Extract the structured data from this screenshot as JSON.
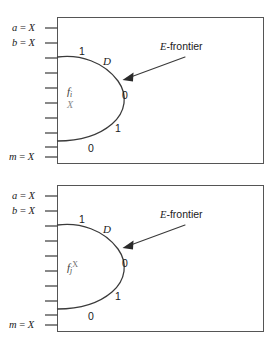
{
  "figure": {
    "type": "diagram",
    "panels": [
      {
        "id": "top",
        "inputs": [
          {
            "label_name": "a",
            "operator": "=",
            "value": "X"
          },
          {
            "label_name": "b",
            "operator": "=",
            "value": "X"
          },
          {
            "label_name": "m",
            "operator": "=",
            "value": "X"
          }
        ],
        "tick_count": 10,
        "curve_bits": [
          {
            "value": "1",
            "position": "upper-left"
          },
          {
            "value": "0",
            "position": "right-upper"
          },
          {
            "value": "1",
            "position": "right-lower"
          },
          {
            "value": "0",
            "position": "lower-left"
          }
        ],
        "d_label": "D",
        "frontier_label_italic": "E",
        "frontier_label_rest": "-frontier",
        "fault_symbol": {
          "base": "f",
          "subscript": "i",
          "superscript": "",
          "below": "X"
        }
      },
      {
        "id": "bottom",
        "inputs": [
          {
            "label_name": "a",
            "operator": "=",
            "value": "X"
          },
          {
            "label_name": "b",
            "operator": "=",
            "value": "X"
          },
          {
            "label_name": "m",
            "operator": "=",
            "value": "X"
          }
        ],
        "tick_count": 10,
        "curve_bits": [
          {
            "value": "1",
            "position": "upper-left"
          },
          {
            "value": "0",
            "position": "right-upper"
          },
          {
            "value": "1",
            "position": "right-lower"
          },
          {
            "value": "0",
            "position": "lower-left"
          }
        ],
        "d_label": "D",
        "frontier_label_italic": "E",
        "frontier_label_rest": "-frontier",
        "fault_symbol": {
          "base": "f",
          "subscript": "j",
          "superscript": "X",
          "below": ""
        }
      }
    ],
    "colors": {
      "line": "#3a3a3a",
      "frame": "#555555",
      "text": "#1a1a1a",
      "muted": "#8a8a8a",
      "background": "#ffffff"
    }
  }
}
